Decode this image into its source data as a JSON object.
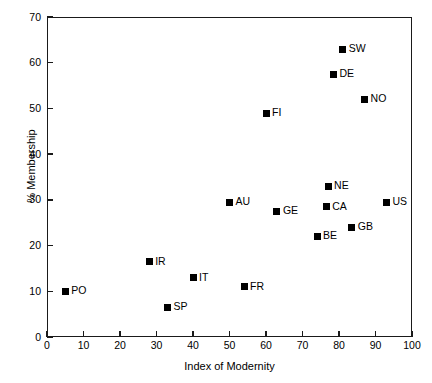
{
  "chart_data": {
    "type": "scatter",
    "title": "",
    "xlabel": "Index of Modernity",
    "ylabel": "% Membership",
    "xlim": [
      0,
      100
    ],
    "ylim": [
      0,
      70
    ],
    "xticks": [
      0,
      10,
      20,
      30,
      40,
      50,
      60,
      70,
      80,
      90,
      100
    ],
    "yticks": [
      0,
      10,
      20,
      30,
      40,
      50,
      60,
      70
    ],
    "grid": false,
    "legend": false,
    "marker_color": "#000000",
    "marker_shape": "square",
    "points": [
      {
        "label": "PO",
        "x": 5,
        "y": 10
      },
      {
        "label": "SP",
        "x": 33,
        "y": 6.5
      },
      {
        "label": "IR",
        "x": 28,
        "y": 16.5
      },
      {
        "label": "IT",
        "x": 40,
        "y": 13
      },
      {
        "label": "FR",
        "x": 54,
        "y": 11
      },
      {
        "label": "AU",
        "x": 50,
        "y": 29.5
      },
      {
        "label": "GE",
        "x": 63,
        "y": 27.5
      },
      {
        "label": "BE",
        "x": 74,
        "y": 22
      },
      {
        "label": "CA",
        "x": 76.5,
        "y": 28.5
      },
      {
        "label": "NE",
        "x": 77,
        "y": 33
      },
      {
        "label": "GB",
        "x": 83.5,
        "y": 24
      },
      {
        "label": "US",
        "x": 93,
        "y": 29.5
      },
      {
        "label": "FI",
        "x": 60,
        "y": 49
      },
      {
        "label": "DE",
        "x": 78.5,
        "y": 57.5
      },
      {
        "label": "SW",
        "x": 81,
        "y": 63
      },
      {
        "label": "NO",
        "x": 87,
        "y": 52
      }
    ]
  }
}
